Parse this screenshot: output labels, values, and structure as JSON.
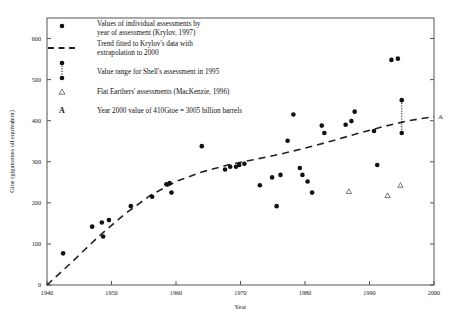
{
  "chart_data": {
    "type": "scatter",
    "title": "",
    "xlabel": "Year",
    "ylabel": "Gtoe (gigatonnes oil equivalent)",
    "xlim": [
      1940,
      2000
    ],
    "ylim": [
      0,
      650
    ],
    "xticks": [
      1940,
      1950,
      1960,
      1970,
      1980,
      1990,
      2000
    ],
    "yticks": [
      0,
      100,
      200,
      300,
      400,
      500,
      600
    ],
    "grid": false,
    "legend_position": "upper-left-inside",
    "series": [
      {
        "name": "Values of individual assessments by year of assessment (Krylov, 1997)",
        "marker": "filled-circle",
        "points": [
          [
            1942.5,
            77
          ],
          [
            1947.0,
            142
          ],
          [
            1948.5,
            152
          ],
          [
            1948.7,
            118
          ],
          [
            1949.6,
            158
          ],
          [
            1953.0,
            192
          ],
          [
            1956.3,
            215
          ],
          [
            1958.5,
            245
          ],
          [
            1959.0,
            248
          ],
          [
            1959.3,
            225
          ],
          [
            1964.0,
            338
          ],
          [
            1967.6,
            281
          ],
          [
            1968.4,
            288
          ],
          [
            1969.3,
            288
          ],
          [
            1969.8,
            292
          ],
          [
            1970.6,
            295
          ],
          [
            1973.0,
            243
          ],
          [
            1974.9,
            262
          ],
          [
            1975.6,
            192
          ],
          [
            1976.2,
            268
          ],
          [
            1977.3,
            351
          ],
          [
            1978.2,
            415
          ],
          [
            1979.2,
            285
          ],
          [
            1979.6,
            268
          ],
          [
            1980.4,
            252
          ],
          [
            1981.1,
            225
          ],
          [
            1982.6,
            388
          ],
          [
            1983.0,
            370
          ],
          [
            1986.3,
            390
          ],
          [
            1987.2,
            399
          ],
          [
            1987.7,
            422
          ],
          [
            1990.7,
            375
          ],
          [
            1991.2,
            292
          ],
          [
            1993.4,
            548
          ],
          [
            1994.4,
            551
          ]
        ]
      },
      {
        "name": "Flat Earthers' assessments (MacKenzie, 1996)",
        "marker": "open-triangle",
        "points": [
          [
            1986.8,
            228
          ],
          [
            1992.8,
            218
          ],
          [
            1994.8,
            243
          ]
        ]
      }
    ],
    "range_marker": {
      "name": "Value range for Shell's assessment in 1995",
      "x": 1995.0,
      "low": 370,
      "high": 450,
      "style": "dotted-bar-with-end-dots"
    },
    "trend": {
      "name": "Trend fitted to Krylov's data with extrapolation to 2000",
      "style": "dashed",
      "points": [
        [
          1940,
          0
        ],
        [
          1944,
          58
        ],
        [
          1948,
          118
        ],
        [
          1952,
          172
        ],
        [
          1956,
          218
        ],
        [
          1960,
          252
        ],
        [
          1964,
          275
        ],
        [
          1968,
          292
        ],
        [
          1972,
          305
        ],
        [
          1976,
          318
        ],
        [
          1980,
          333
        ],
        [
          1984,
          350
        ],
        [
          1988,
          368
        ],
        [
          1992,
          385
        ],
        [
          1996,
          400
        ],
        [
          2000,
          410
        ]
      ]
    },
    "annotations": [
      {
        "label": "A",
        "x": 2000,
        "y": 410,
        "note": "Year 2000 value of 410Gtoe = 3005 billion barrels"
      }
    ]
  },
  "legend": {
    "items": [
      {
        "marker": "filled-circle",
        "line1": "Values of individual assessments by",
        "line2": "year of assessment (Krylov, 1997)"
      },
      {
        "marker": "dashed-line",
        "line1": "Trend fitted to Krylov's data with",
        "line2": "extrapolation to 2000"
      },
      {
        "marker": "dotted-range-bar",
        "line1": "Value range for Shell's assessment in 1995",
        "line2": ""
      },
      {
        "marker": "open-triangle",
        "line1": "Flat Earthers' assessments (MacKenzie, 1996)",
        "line2": ""
      },
      {
        "marker": "letter-A",
        "line1": "Year 2000 value of 410Gtoe = 3005 billion barrels",
        "line2": ""
      }
    ]
  },
  "axis_text": {
    "x_title": "Year",
    "y_title": "Gtoe (gigatonnes oil equivalent)",
    "x_tick_labels": [
      "1940",
      "1950",
      "1960",
      "1970",
      "1980",
      "1990",
      "2000"
    ],
    "y_tick_labels": [
      "0",
      "100",
      "200",
      "300",
      "400",
      "500",
      "600"
    ],
    "axis_annotation": "A"
  },
  "colors": {
    "marker": "#111111",
    "axis": "#555555",
    "trend": "#222222",
    "triangle": "#555555"
  }
}
